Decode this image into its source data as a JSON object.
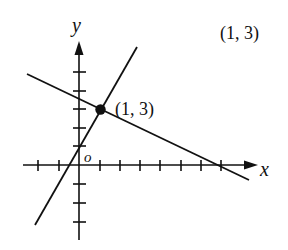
{
  "diagram": {
    "type": "coordinate-plane",
    "axes": {
      "x_label": "x",
      "y_label": "y",
      "origin_label": "O",
      "x_ticks": [
        -2,
        -1,
        1,
        2,
        3,
        4,
        5,
        6,
        7
      ],
      "y_ticks": [
        -3,
        -2,
        -1,
        1,
        2,
        3,
        4,
        5
      ]
    },
    "lines": [
      {
        "name": "steep-line",
        "equation": "y = 2x + 1",
        "passes_through": [
          [
            0,
            1
          ],
          [
            1,
            3
          ]
        ]
      },
      {
        "name": "shallow-line",
        "equation": "y = -x/2 + 7/2",
        "passes_through": [
          [
            1,
            3
          ],
          [
            7,
            0
          ]
        ]
      }
    ],
    "intersection_point": {
      "x": 1,
      "y": 3,
      "label": "(1, 3)"
    },
    "caption": "(1, 3)",
    "colors": {
      "ink": "#111111",
      "background": "#ffffff"
    }
  }
}
